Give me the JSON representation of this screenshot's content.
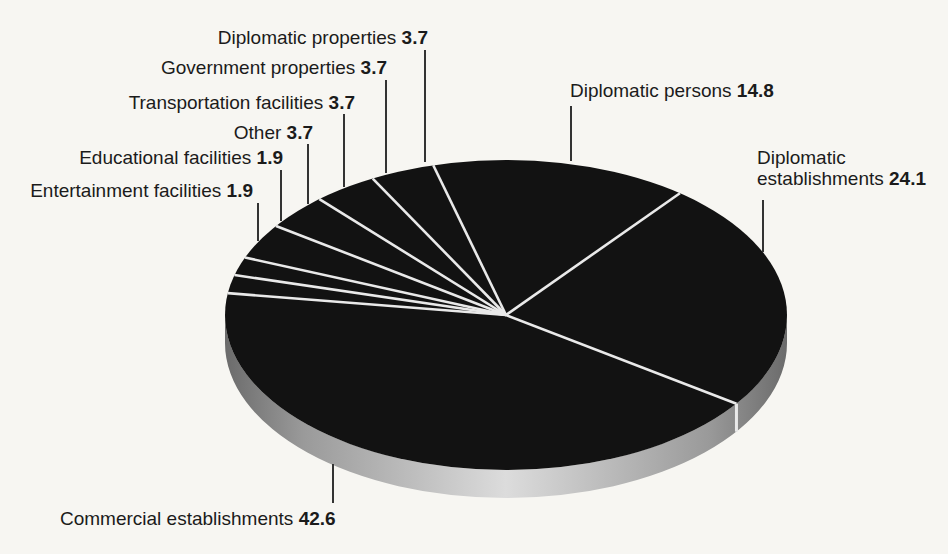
{
  "chart_data": {
    "type": "pie",
    "style": "3d",
    "direction": "clockwise",
    "start_angle_deg": 105,
    "slices": [
      {
        "label": "Diplomatic persons",
        "value": 14.8
      },
      {
        "label": "Diplomatic establishments",
        "value": 24.1
      },
      {
        "label": "Commercial establishments",
        "value": 42.6
      },
      {
        "label": "Entertainment facilities",
        "value": 1.9
      },
      {
        "label": "Educational facilities",
        "value": 1.9
      },
      {
        "label": "Other",
        "value": 3.7
      },
      {
        "label": "Transportation facilities",
        "value": 3.7
      },
      {
        "label": "Government properties",
        "value": 3.7
      },
      {
        "label": "Diplomatic properties",
        "value": 3.7
      }
    ],
    "legend_position": "callout-labels",
    "grid": false,
    "colors": {
      "slice_fill": "#121212",
      "divider": "#e9e9e9",
      "rim_dark": "#6b6b6b",
      "rim_mid": "#9a9a9a",
      "rim_light": "#dcdcdc",
      "leader_line": "#333333",
      "background": "#f7f6f2",
      "text": "#1b1b1b"
    }
  }
}
